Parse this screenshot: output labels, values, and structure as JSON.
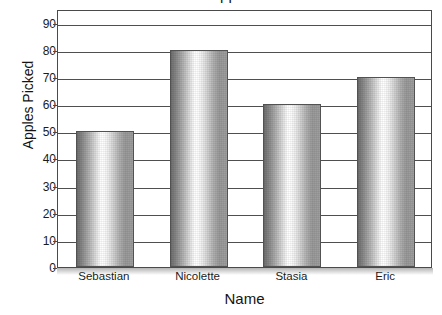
{
  "chart_data": {
    "type": "bar",
    "title": "Number of Apples Picked",
    "xlabel": "Name",
    "ylabel": "Apples Picked",
    "categories": [
      "Sebastian",
      "Nicolette",
      "Stasia",
      "Eric"
    ],
    "values": [
      50,
      80,
      60,
      70
    ],
    "ylim": [
      0,
      95
    ],
    "ytick_step": 10,
    "yticks": [
      0,
      10,
      20,
      30,
      40,
      50,
      60,
      70,
      80,
      90
    ],
    "ytick_labels": [
      "0",
      "10",
      "20",
      "30",
      "40",
      "50",
      "60",
      "70",
      "80",
      "90"
    ],
    "grid": true,
    "grid_axis": "y",
    "legend": false,
    "legend_position": "none",
    "series": [
      {
        "name": "Apples Picked",
        "values": [
          50,
          80,
          60,
          70
        ]
      }
    ],
    "annotations": [],
    "colors": {
      "bar_edge": "#525252",
      "bar_fill_light": "#ffffff",
      "bar_fill_dark": "#6e6e6e",
      "gridline": "#4f4f4f",
      "axis": "#4a4a4a",
      "text": "#1b1b1b",
      "background": "#ffffff"
    }
  }
}
